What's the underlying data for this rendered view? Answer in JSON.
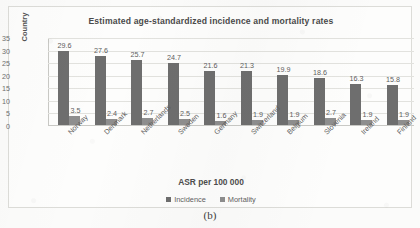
{
  "chart_data": {
    "type": "bar",
    "title": "Estimated age-standardized incidence and mortality rates",
    "xlabel": "ASR per 100 000",
    "ylabel": "Country",
    "categories": [
      "Norway",
      "Denmark",
      "Netherlands",
      "Sweden",
      "Germany",
      "Switzerland",
      "Belgium",
      "Slovenia",
      "Ireland",
      "Finland"
    ],
    "series": [
      {
        "name": "Incidence",
        "color": "#6e6e6e",
        "values": [
          29.6,
          27.6,
          25.7,
          24.7,
          21.6,
          21.3,
          19.9,
          18.6,
          16.3,
          15.8
        ]
      },
      {
        "name": "Mortality",
        "color": "#8e8e8e",
        "values": [
          3.5,
          2.4,
          2.7,
          2.5,
          1.6,
          1.9,
          1.9,
          2.7,
          1.9,
          1.9
        ]
      }
    ],
    "ylim": [
      0,
      35
    ],
    "yticks": [
      35,
      30,
      25,
      20,
      15,
      10,
      5,
      0
    ],
    "grid": true,
    "legend_position": "bottom",
    "data_labels": true
  },
  "caption": "(b)"
}
